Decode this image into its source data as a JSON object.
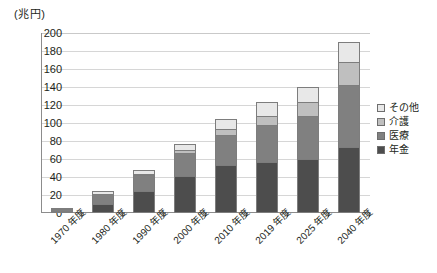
{
  "chart_data": {
    "type": "bar",
    "stacked": true,
    "title": "",
    "unit_caption": "(兆円)",
    "xlabel": "",
    "ylabel": "",
    "ylim": [
      0,
      200
    ],
    "ytick_step": 20,
    "yticks": [
      "200",
      "180",
      "160",
      "140",
      "120",
      "100",
      "80",
      "60",
      "40",
      "20",
      "0"
    ],
    "grid": true,
    "legend_position": "right",
    "categories": [
      "1970 年度",
      "1980 年度",
      "1990 年度",
      "2000 年度",
      "2010 年度",
      "2019 年度",
      "2025 年度",
      "2040 年度"
    ],
    "series": [
      {
        "name": "年金",
        "color": "#4d4d4d",
        "values": [
          0.9,
          10.5,
          24.0,
          41.2,
          53.0,
          56.9,
          59.9,
          73.2
        ]
      },
      {
        "name": "医療",
        "color": "#808080",
        "values": [
          2.1,
          10.7,
          18.4,
          26.0,
          33.2,
          40.6,
          47.8,
          68.5
        ]
      },
      {
        "name": "介護",
        "color": "#bfbfbf",
        "values": [
          0.0,
          0.0,
          0.9,
          3.3,
          7.4,
          10.7,
          15.3,
          25.8
        ]
      },
      {
        "name": "その他",
        "color": "#e8e8e8",
        "values": [
          0.5,
          3.5,
          4.0,
          6.0,
          11.0,
          15.4,
          17.0,
          22.5
        ]
      }
    ],
    "totals": [
      3.5,
      24.7,
      47.3,
      76.5,
      104.6,
      123.6,
      140.0,
      190.0
    ]
  },
  "legend": {
    "items": [
      {
        "label": "その他",
        "color": "#e8e8e8"
      },
      {
        "label": "介護",
        "color": "#bfbfbf"
      },
      {
        "label": "医療",
        "color": "#808080"
      },
      {
        "label": "年金",
        "color": "#4d4d4d"
      }
    ]
  }
}
